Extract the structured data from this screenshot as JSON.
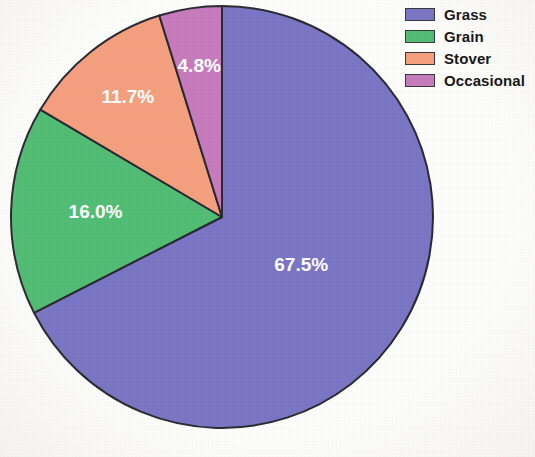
{
  "chart_data": {
    "type": "pie",
    "title": "",
    "subtitle": "",
    "xlabel": "",
    "ylabel": "",
    "legend_position": "top-right",
    "grid": false,
    "start_angle_deg": 0,
    "direction": "clockwise",
    "categories": [
      "Grass",
      "Grain",
      "Stover",
      "Occasional"
    ],
    "values": [
      67.5,
      16.0,
      11.7,
      4.8
    ],
    "value_unit": "%",
    "total": 100.0,
    "colors": [
      "#7b76c4",
      "#52bd74",
      "#f4a07f",
      "#c77bbd"
    ],
    "slices": [
      {
        "label": "Grass",
        "value": 67.5,
        "display": "67.5%",
        "color": "#7b76c4"
      },
      {
        "label": "Grain",
        "value": 16.0,
        "display": "16.0%",
        "color": "#52bd74"
      },
      {
        "label": "Stover",
        "value": 11.7,
        "display": "11.7%",
        "color": "#f4a07f"
      },
      {
        "label": "Occasional",
        "value": 4.8,
        "display": "4.8%",
        "color": "#c77bbd"
      }
    ],
    "slice_outline_color": "#2b2b33",
    "label_text_color": "#ffffff"
  },
  "legend": {
    "items": [
      {
        "label": "Grass",
        "color": "#7b76c4"
      },
      {
        "label": "Grain",
        "color": "#52bd74"
      },
      {
        "label": "Stover",
        "color": "#f4a07f"
      },
      {
        "label": "Occasional",
        "color": "#c77bbd"
      }
    ]
  }
}
